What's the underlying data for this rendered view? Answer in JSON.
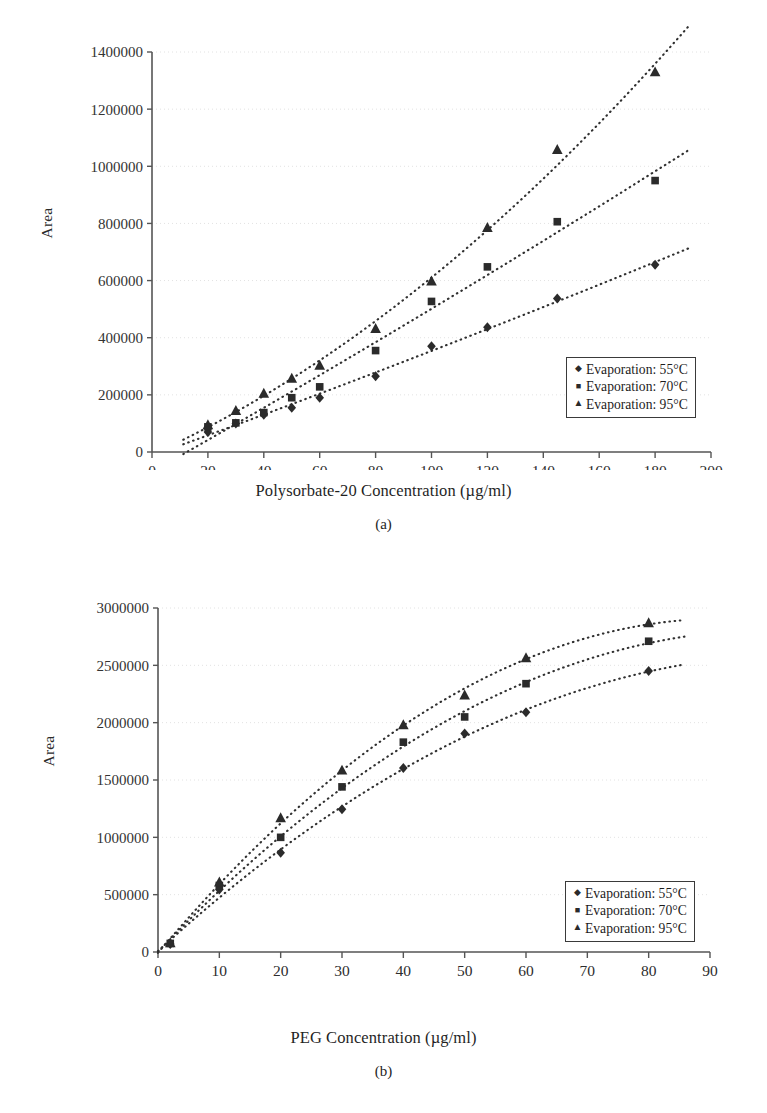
{
  "figure": {
    "panels": [
      {
        "id": "a",
        "caption": "(a)",
        "legend": [
          {
            "glyph": "diamond-marker-icon",
            "label": "Evaporation: 55°C"
          },
          {
            "glyph": "square-marker-icon",
            "label": "Evaporation: 70°C"
          },
          {
            "glyph": "triangle-marker-icon",
            "label": "Evaporation: 95°C"
          }
        ]
      },
      {
        "id": "b",
        "caption": "(b)",
        "legend": [
          {
            "glyph": "diamond-marker-icon",
            "label": "Evaporation: 55°C"
          },
          {
            "glyph": "square-marker-icon",
            "label": "Evaporation: 70°C"
          },
          {
            "glyph": "triangle-marker-icon",
            "label": "Evaporation: 95°C"
          }
        ]
      }
    ],
    "colors": {
      "marker": "#2b2b2b",
      "trendline": "#303030",
      "axis": "#555555",
      "gridline": "#e2e2e2",
      "text": "#1f1f1f",
      "background": "#ffffff"
    }
  },
  "chart_data": [
    {
      "type": "scatter",
      "panel": "a",
      "title": "",
      "xlabel": "Polysorbate-20 Concentration (µg/ml)",
      "ylabel": "Area",
      "xlim": [
        0,
        200
      ],
      "ylim": [
        0,
        1400000
      ],
      "xticks": [
        0,
        20,
        40,
        60,
        80,
        100,
        120,
        140,
        160,
        180,
        200
      ],
      "xtick_labels": [
        "0",
        "20",
        "40",
        "60",
        "80",
        "100",
        "120",
        "140",
        "160",
        "180",
        "200"
      ],
      "yticks": [
        0,
        200000,
        400000,
        600000,
        800000,
        1000000,
        1200000,
        1400000
      ],
      "ytick_labels": [
        "0",
        "200000",
        "400000",
        "600000",
        "800000",
        "1000000",
        "1200000",
        "1400000"
      ],
      "grid": "horizontal-dotted",
      "legend_position": "bottom-right",
      "trendline": "dotted-polynomial",
      "series": [
        {
          "name": "Evaporation: 55°C",
          "marker": "diamond",
          "x": [
            20,
            30,
            40,
            50,
            60,
            80,
            100,
            120,
            145,
            180
          ],
          "y": [
            70000,
            100000,
            130000,
            155000,
            190000,
            265000,
            370000,
            437000,
            537000,
            655000
          ]
        },
        {
          "name": "Evaporation: 70°C",
          "marker": "square",
          "x": [
            20,
            30,
            40,
            50,
            60,
            80,
            100,
            120,
            145,
            180
          ],
          "y": [
            88000,
            102000,
            138000,
            190000,
            228000,
            355000,
            527000,
            648000,
            806000,
            950000
          ]
        },
        {
          "name": "Evaporation: 95°C",
          "marker": "triangle",
          "x": [
            20,
            30,
            40,
            50,
            60,
            80,
            100,
            120,
            145,
            180
          ],
          "y": [
            95000,
            145000,
            205000,
            258000,
            303000,
            432000,
            598000,
            785000,
            1058000,
            1330000
          ]
        }
      ]
    },
    {
      "type": "scatter",
      "panel": "b",
      "title": "",
      "xlabel": "PEG Concentration (µg/ml)",
      "ylabel": "Area",
      "xlim": [
        0,
        90
      ],
      "ylim": [
        0,
        3000000
      ],
      "xticks": [
        0,
        10,
        20,
        30,
        40,
        50,
        60,
        70,
        80,
        90
      ],
      "xtick_labels": [
        "0",
        "10",
        "20",
        "30",
        "40",
        "50",
        "60",
        "70",
        "80",
        "90"
      ],
      "yticks": [
        0,
        500000,
        1000000,
        1500000,
        2000000,
        2500000,
        3000000
      ],
      "ytick_labels": [
        "0",
        "500000",
        "1000000",
        "1500000",
        "2000000",
        "2500000",
        "3000000"
      ],
      "grid": "horizontal-dotted",
      "legend_position": "bottom-right",
      "trendline": "dotted-polynomial",
      "series": [
        {
          "name": "Evaporation: 55°C",
          "marker": "diamond",
          "x": [
            2,
            10,
            20,
            30,
            40,
            50,
            60,
            80
          ],
          "y": [
            70000,
            545000,
            865000,
            1245000,
            1605000,
            1905000,
            2090000,
            2450000
          ]
        },
        {
          "name": "Evaporation: 70°C",
          "marker": "square",
          "x": [
            2,
            10,
            20,
            30,
            40,
            50,
            60,
            80
          ],
          "y": [
            75000,
            580000,
            1000000,
            1440000,
            1830000,
            2050000,
            2340000,
            2710000
          ]
        },
        {
          "name": "Evaporation: 95°C",
          "marker": "triangle",
          "x": [
            2,
            10,
            20,
            30,
            40,
            50,
            60,
            80
          ],
          "y": [
            80000,
            610000,
            1170000,
            1585000,
            1980000,
            2240000,
            2565000,
            2870000
          ]
        }
      ]
    }
  ]
}
